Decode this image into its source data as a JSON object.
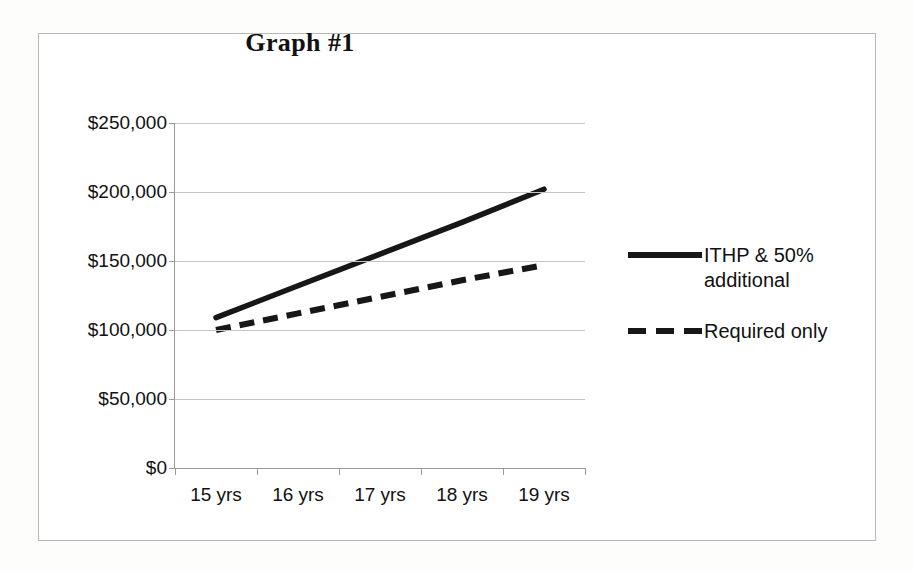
{
  "chart_data": {
    "type": "line",
    "title": "Graph #1",
    "xlabel": "",
    "ylabel": "",
    "categories": [
      "15 yrs",
      "16 yrs",
      "17 yrs",
      "18 yrs",
      "19 yrs"
    ],
    "ylim": [
      0,
      250000
    ],
    "ytick_values": [
      0,
      50000,
      100000,
      150000,
      200000,
      250000
    ],
    "ytick_labels": [
      "$0",
      "$50,000",
      "$100,000",
      "$150,000",
      "$200,000",
      "$250,000"
    ],
    "grid": true,
    "legend_position": "right",
    "series": [
      {
        "name": "ITHP & 50% additional",
        "style": "solid",
        "color": "#171717",
        "values": [
          109000,
          132000,
          155000,
          178000,
          202000
        ]
      },
      {
        "name": "Required only",
        "style": "dashed",
        "color": "#171717",
        "values": [
          100000,
          112000,
          124000,
          136000,
          147000
        ]
      }
    ]
  },
  "legend": {
    "items": [
      {
        "label": "ITHP & 50% additional",
        "swatch": "solid-line-swatch"
      },
      {
        "label": "Required only",
        "swatch": "dashed-line-swatch"
      }
    ]
  }
}
